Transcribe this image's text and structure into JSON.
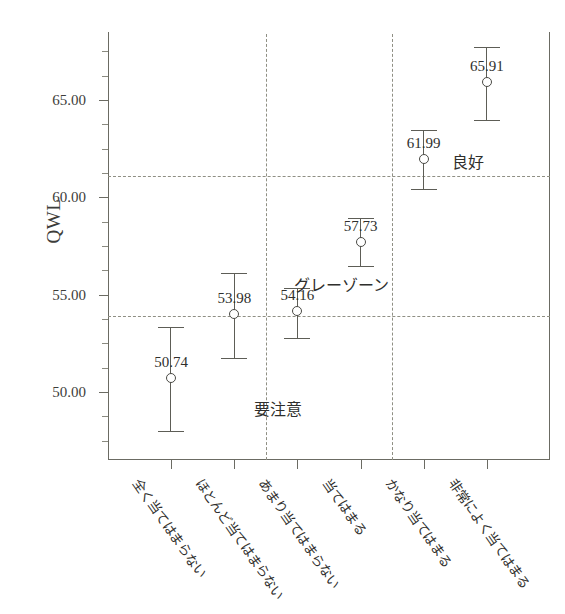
{
  "chart_data": {
    "type": "scatter",
    "title": "",
    "xlabel": "",
    "ylabel": "QWL",
    "ylim": [
      46.5,
      68.5
    ],
    "grid": false,
    "legend": "none",
    "categories": [
      "全く当てはまらない",
      "ほとんど当てはまらない",
      "あまり当てはまらない",
      "当てはまる",
      "かなり当てはまる",
      "非常によく当てはまる"
    ],
    "values": [
      50.74,
      53.98,
      54.16,
      57.73,
      61.99,
      65.91
    ],
    "value_labels": [
      "50.74",
      "53.98",
      "54.16",
      "57.73",
      "61.99",
      "65.91"
    ],
    "error_bars": {
      "lower": [
        47.98,
        51.73,
        52.76,
        56.48,
        60.43,
        63.96
      ],
      "upper": [
        53.36,
        56.1,
        55.35,
        58.95,
        63.45,
        67.72
      ]
    },
    "yticks": [
      50.0,
      55.0,
      60.0,
      65.0
    ],
    "ytick_labels": [
      "50.00",
      "55.00",
      "60.00",
      "65.00"
    ],
    "reference_lines": {
      "horizontal": [
        53.9,
        61.1
      ],
      "vertical_between_categories": [
        2,
        4
      ]
    },
    "zone_annotations": [
      {
        "label": "要注意",
        "category_index": 1,
        "y": 49.2
      },
      {
        "label": "グレーゾーン",
        "category_index": 2,
        "y": 55.6
      },
      {
        "label": "良好",
        "category_index": 4,
        "y": 61.9
      }
    ]
  },
  "axis": {
    "y_title": "QWL"
  }
}
